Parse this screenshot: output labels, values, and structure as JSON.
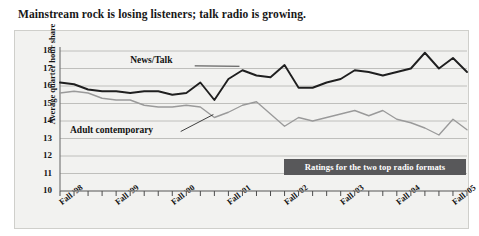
{
  "figure": {
    "title": "Mainstream rock is losing listeners; talk radio is growing.",
    "callout": "Ratings for the two top radio formats",
    "background_color": "#ffffff",
    "plot_background_color": "#f2f2f0",
    "plot_border_color": "#cfcfcb",
    "gridline_color": "#b9b9b5",
    "callout_background_color": "#58585a",
    "callout_text_color": "#ffffff"
  },
  "chart_data": {
    "type": "line",
    "title": "Mainstream rock is losing listeners; talk radio is growing.",
    "subtitle": "Ratings for the two top radio formats",
    "xlabel": "",
    "ylabel": "Average quarter hour share",
    "ylim": [
      10,
      18
    ],
    "yticks": [
      10,
      11,
      12,
      13,
      14,
      15,
      16,
      17,
      18
    ],
    "ytick_labels": [
      "10",
      "11",
      "12",
      "13",
      "14",
      "15",
      "16",
      "17",
      "18"
    ],
    "grid": true,
    "grid_axis": "y",
    "legend": "inline-annotations",
    "legend_position": "in-plot",
    "x_major_labels": [
      "Fall '98",
      "Fall '99",
      "Fall '00",
      "Fall '01",
      "Fall '02",
      "Fall '03",
      "Fall '04",
      "Fall '05"
    ],
    "x_major_indices": [
      0,
      4,
      8,
      12,
      16,
      20,
      24,
      28
    ],
    "x_tick_count": 30,
    "x": [
      0,
      1,
      2,
      3,
      4,
      5,
      6,
      7,
      8,
      9,
      10,
      11,
      12,
      13,
      14,
      15,
      16,
      17,
      18,
      19,
      20,
      21,
      22,
      23,
      24,
      25,
      26,
      27,
      28,
      29
    ],
    "series": [
      {
        "name": "News/Talk",
        "color": "#1f1f1f",
        "values": [
          16.2,
          16.1,
          15.8,
          15.7,
          15.7,
          15.6,
          15.7,
          15.7,
          15.5,
          15.6,
          16.2,
          15.2,
          16.4,
          16.9,
          16.6,
          16.5,
          17.2,
          15.9,
          15.9,
          16.2,
          16.4,
          16.9,
          16.8,
          16.6,
          16.8,
          17.0,
          17.9,
          17.0,
          17.6,
          16.8
        ]
      },
      {
        "name": "Adult contemporary",
        "color": "#9a9a9a",
        "values": [
          15.6,
          15.7,
          15.6,
          15.3,
          15.2,
          15.2,
          14.9,
          14.8,
          14.8,
          14.9,
          14.8,
          14.2,
          14.5,
          14.9,
          15.1,
          14.4,
          13.7,
          14.2,
          14.0,
          14.2,
          14.4,
          14.6,
          14.3,
          14.6,
          14.1,
          13.9,
          13.6,
          13.2,
          14.1,
          13.5
        ]
      }
    ],
    "annotations": [
      {
        "text": "News/Talk",
        "target_x": 13,
        "target_y": 16.9
      },
      {
        "text": "Adult contemporary",
        "target_x": 11,
        "target_y": 14.2
      }
    ]
  },
  "axis": {
    "y_title": "Average quarter hour share"
  }
}
